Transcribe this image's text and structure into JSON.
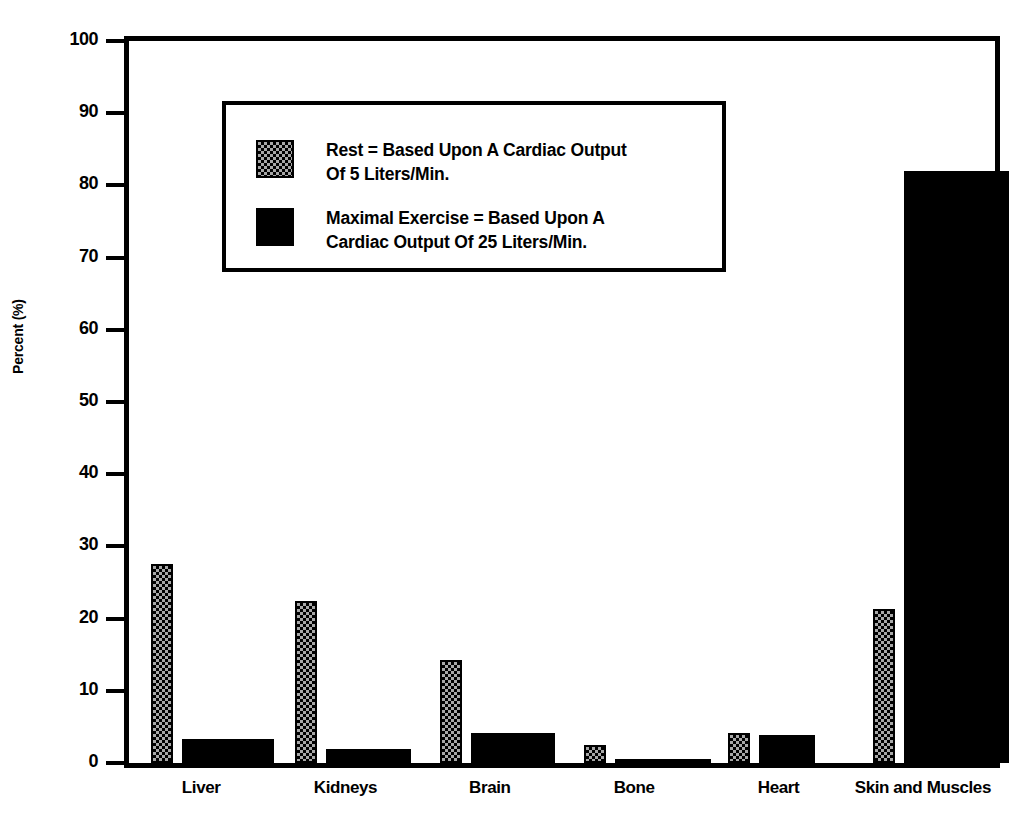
{
  "chart_data": {
    "type": "bar",
    "title": "",
    "xlabel": "",
    "ylabel": "Percent (%)",
    "ylim": [
      0,
      100
    ],
    "ytick_values": [
      0,
      10,
      20,
      30,
      40,
      50,
      60,
      70,
      80,
      90,
      100
    ],
    "ytick_labels": [
      "0",
      "10",
      "20",
      "30",
      "40",
      "50",
      "60",
      "70",
      "80",
      "90",
      "100"
    ],
    "grid": false,
    "legend_position": "upper-left-inside",
    "categories": [
      "Liver",
      "Kidneys",
      "Brain",
      "Bone",
      "Heart",
      "Skin and Muscles"
    ],
    "series": [
      {
        "name": "Rest",
        "legend_label_line1": "Rest  =  Based Upon A Cardiac Output",
        "legend_label_line2": "Of 5 Liters/Min.",
        "fill": "checkered-gray",
        "color": "#a8a8a8",
        "values": [
          27.5,
          22.5,
          14.3,
          2.5,
          4.2,
          21.3
        ]
      },
      {
        "name": "Maximal Exercise",
        "legend_label_line1": "Maximal Exercise  =  Based Upon A",
        "legend_label_line2": "Cardiac Output Of 25 Liters/Min.",
        "fill": "solid-black",
        "color": "#000000",
        "values": [
          3.3,
          2.0,
          4.2,
          0.5,
          3.9,
          82.0
        ]
      }
    ]
  },
  "axis": {
    "ylabel": "Percent (%)"
  },
  "legend": {
    "rows": [
      {
        "series": "Rest",
        "line1": "Rest  =  Based Upon A Cardiac Output",
        "line2": "Of 5 Liters/Min."
      },
      {
        "series": "Maximal Exercise",
        "line1": "Maximal Exercise  =  Based Upon A",
        "line2": "Cardiac Output Of 25 Liters/Min."
      }
    ]
  }
}
